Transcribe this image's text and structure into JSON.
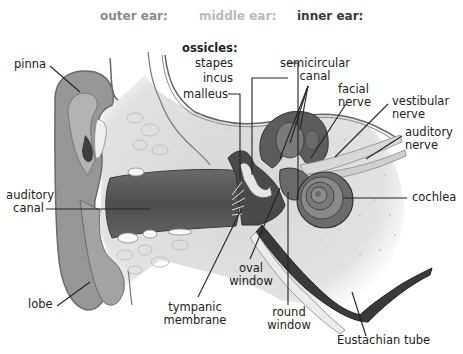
{
  "header": {
    "outer": {
      "text": "outer ear:",
      "color": "#8a8a8a"
    },
    "middle": {
      "text": "middle ear:",
      "color": "#b9b9b9"
    },
    "inner": {
      "text": "inner ear:",
      "color": "#3a3a3a"
    }
  },
  "labels": {
    "pinna": "pinna",
    "ossicles_title": "ossicles:",
    "stapes": "stapes",
    "incus": "incus",
    "malleus": "malleus",
    "semicircular_1": "semicircular",
    "semicircular_2": "canal",
    "facial_1": "facial",
    "facial_2": "nerve",
    "vestibular_1": "vestibular",
    "vestibular_2": "nerve",
    "auditory_nerve_1": "auditory",
    "auditory_nerve_2": "nerve",
    "auditory_canal_1": "auditory",
    "auditory_canal_2": "canal",
    "cochlea": "cochlea",
    "lobe": "lobe",
    "oval_1": "oval",
    "oval_2": "window",
    "round_1": "round",
    "round_2": "window",
    "tympanic_1": "tympanic",
    "tympanic_2": "membrane",
    "eustachian": "Eustachian tube"
  },
  "colors": {
    "skin": "#8e8e8e",
    "skin_light": "#b5b5b5",
    "bone": "#dcdcdc",
    "canal": "#5a5a5a",
    "leader": "#222222"
  }
}
